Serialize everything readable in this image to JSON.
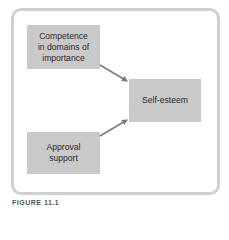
{
  "diagram": {
    "nodes": [
      {
        "id": "competence",
        "label_lines": [
          "Competence",
          "in domains of",
          "importance"
        ]
      },
      {
        "id": "self_esteem",
        "label_lines": [
          "Self-esteem"
        ]
      },
      {
        "id": "approval",
        "label_lines": [
          "Approval",
          "support"
        ]
      }
    ],
    "edges": [
      {
        "from": "competence",
        "to": "self_esteem"
      },
      {
        "from": "approval",
        "to": "self_esteem"
      }
    ],
    "caption": "FIGURE 11.1"
  },
  "colors": {
    "node_fill": "#c9c9c9",
    "arrow": "#7a7a7a",
    "frame_border": "#d0d0d0"
  }
}
